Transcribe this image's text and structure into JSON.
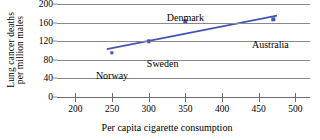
{
  "chart_data": {
    "type": "scatter",
    "title": "",
    "xlabel": "Per capita cigarette consumption",
    "ylabel_line1": "Lung cancer deaths",
    "ylabel_line2": "per million males",
    "xlim": [
      175,
      520
    ],
    "ylim": [
      0,
      200
    ],
    "xticks": [
      200,
      250,
      300,
      350,
      400,
      450,
      500
    ],
    "yticks": [
      0,
      40,
      80,
      120,
      160,
      200
    ],
    "grid": "horizontal",
    "legend": "none",
    "series_color": "#4255b5",
    "points": [
      {
        "label": "Norway",
        "x": 250,
        "y": 95,
        "label_dx": 0,
        "label_dy": 17
      },
      {
        "label": "Sweden",
        "x": 300,
        "y": 120,
        "label_dx": 14,
        "label_dy": 17
      },
      {
        "label": "Denmark",
        "x": 350,
        "y": 163,
        "label_dx": 0,
        "label_dy": -9
      },
      {
        "label": "Australia",
        "x": 470,
        "y": 167,
        "label_dx": -3,
        "label_dy": 20
      }
    ],
    "trendline": {
      "x0": 243,
      "y0": 103,
      "x1": 475,
      "y1": 175
    }
  }
}
